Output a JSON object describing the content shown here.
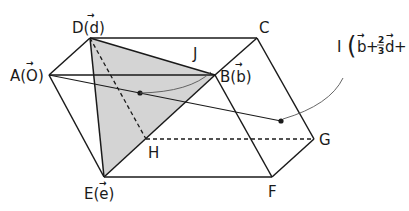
{
  "diagram": {
    "type": "parallelepiped",
    "colors": {
      "shade": "#d4d4d4",
      "line": "#1a1a1a",
      "background": "#ffffff"
    },
    "vertices": {
      "A": {
        "label": "A",
        "vector": "O",
        "x": 49,
        "y": 75
      },
      "B": {
        "label": "B",
        "vector": "b",
        "x": 215,
        "y": 75
      },
      "C": {
        "label": "C",
        "vector": "",
        "x": 257,
        "y": 38
      },
      "D": {
        "label": "D",
        "vector": "d",
        "x": 90,
        "y": 38
      },
      "E": {
        "label": "E",
        "vector": "e",
        "x": 104,
        "y": 177
      },
      "F": {
        "label": "F",
        "vector": "",
        "x": 272,
        "y": 177
      },
      "G": {
        "label": "G",
        "vector": "",
        "x": 314,
        "y": 139
      },
      "H": {
        "label": "H",
        "vector": "",
        "x": 146,
        "y": 139
      }
    },
    "points": {
      "J": {
        "label": "J",
        "x": 140,
        "y": 93
      },
      "I": {
        "label": "I",
        "x": 281,
        "y": 121,
        "expression": {
          "b": "b",
          "plus": "+",
          "frac_num": "2",
          "frac_den": "3",
          "d": "d",
          "e": "e",
          "open": "(",
          "close": ")"
        }
      }
    },
    "shaded_face": [
      "D",
      "B",
      "E"
    ],
    "hidden_edges": [
      "D-H",
      "H-G"
    ],
    "segment": [
      "A",
      "I"
    ]
  },
  "labels": {
    "D": "D(d)",
    "A": "A(O)",
    "B": "B(b)",
    "C": "C",
    "E": "E(e)",
    "F": "F",
    "G": "G",
    "H": "H",
    "J": "J",
    "I_prefix": "I"
  }
}
